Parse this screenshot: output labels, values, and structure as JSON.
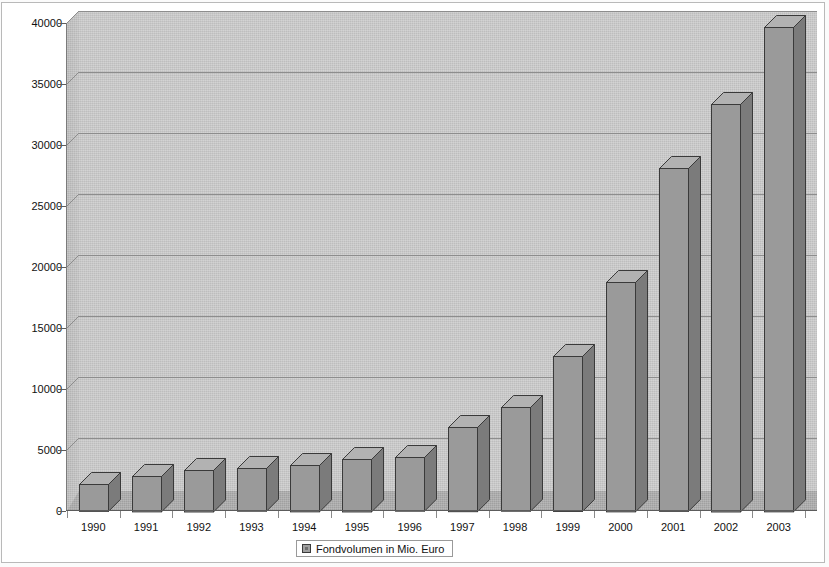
{
  "chart_data": {
    "type": "bar",
    "title": "",
    "subtitle": "",
    "xlabel": "",
    "ylabel": "",
    "categories": [
      "1990",
      "1991",
      "1992",
      "1993",
      "1994",
      "1995",
      "1996",
      "1997",
      "1998",
      "1999",
      "2000",
      "2001",
      "2002",
      "2003"
    ],
    "series": [
      {
        "name": "Fondvolumen in Mio. Euro",
        "values": [
          2200,
          2900,
          3400,
          3500,
          3800,
          4300,
          4400,
          6900,
          8500,
          12700,
          18800,
          28100,
          33400,
          39700
        ]
      }
    ],
    "ylim": [
      0,
      40000
    ],
    "ytick_labels": [
      "0",
      "5000",
      "10000",
      "15000",
      "20000",
      "25000",
      "30000",
      "35000",
      "40000"
    ],
    "ytick_values": [
      0,
      5000,
      10000,
      15000,
      20000,
      25000,
      30000,
      35000,
      40000
    ],
    "grid": true,
    "legend_position": "bottom",
    "legend_entries": [
      "Fondvolumen in Mio. Euro"
    ],
    "style": "3d-column",
    "colors": {
      "bar_front": "#9a9a9a",
      "bar_side": "#7b7b7b",
      "bar_top": "#b2b2b2",
      "bar_outline": "#3a3a3a",
      "plot_back_wall": "#c9c9c9",
      "plot_side_wall": "#bdbdbd",
      "plot_floor": "#a9a9a9",
      "gridline": "#8d8d8d",
      "axis": "#5c5c5c",
      "text": "#111111",
      "page_background": "#fbfbfb"
    }
  },
  "legend": {
    "label": "Fondvolumen in Mio. Euro",
    "swatch_name": "series-swatch"
  }
}
